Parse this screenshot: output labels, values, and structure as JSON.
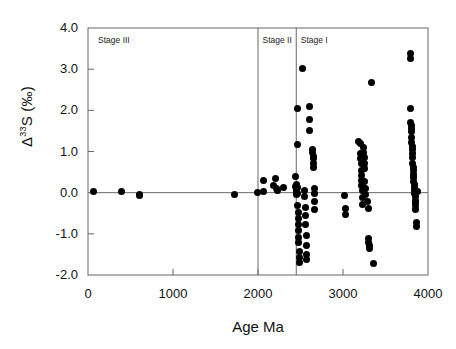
{
  "chart_data": {
    "type": "scatter",
    "title": "",
    "xlabel": "Age Ma",
    "ylabel": "Δ33S (‰)",
    "ylabel_base": "Δ",
    "ylabel_sup": "33",
    "ylabel_tail": "S (‰)",
    "xlim": [
      0,
      4000
    ],
    "ylim": [
      -2.0,
      4.0
    ],
    "xticks": [
      0,
      1000,
      2000,
      3000,
      4000
    ],
    "yticks": [
      4.0,
      3.0,
      2.0,
      1.0,
      0.0,
      -1.0,
      -2.0
    ],
    "xticklabels": [
      "0",
      "1000",
      "2000",
      "3000",
      "4000"
    ],
    "yticklabels": [
      "4.0",
      "3.0",
      "2.0",
      "1.0",
      "0.0",
      "-1.0",
      "-2.0"
    ],
    "grid": false,
    "legend": null,
    "marker": "filled-circle",
    "marker_color": "#000000",
    "zero_line": 0.0,
    "annotations": [
      {
        "label": "Stage III",
        "x_range": [
          0,
          2000
        ],
        "text_x": 95,
        "text_y": 3.72
      },
      {
        "label": "Stage II",
        "x_range": [
          2000,
          2450
        ],
        "text_x": 2030,
        "text_y": 3.72
      },
      {
        "label": "Stage I",
        "x_range": [
          2450,
          4000
        ],
        "text_x": 2480,
        "text_y": 3.72
      }
    ],
    "divider_lines": [
      2000,
      2450
    ],
    "series": [
      {
        "name": "Δ33S measurements",
        "points": [
          [
            60,
            0.02
          ],
          [
            390,
            0.03
          ],
          [
            600,
            -0.05
          ],
          [
            605,
            -0.08
          ],
          [
            1720,
            -0.04
          ],
          [
            1990,
            0.0
          ],
          [
            2060,
            0.3
          ],
          [
            2065,
            0.02
          ],
          [
            2180,
            0.18
          ],
          [
            2200,
            0.35
          ],
          [
            2215,
            0.1
          ],
          [
            2230,
            0.05
          ],
          [
            2300,
            0.12
          ],
          [
            2440,
            0.4
          ],
          [
            2445,
            0.15
          ],
          [
            2450,
            0.08
          ],
          [
            2452,
            0.02
          ],
          [
            2455,
            -0.05
          ],
          [
            2458,
            0.2
          ],
          [
            2460,
            2.05
          ],
          [
            2462,
            1.18
          ],
          [
            2465,
            0.12
          ],
          [
            2468,
            -0.02
          ],
          [
            2470,
            -0.3
          ],
          [
            2472,
            -0.48
          ],
          [
            2474,
            -0.62
          ],
          [
            2476,
            -0.78
          ],
          [
            2478,
            -0.92
          ],
          [
            2480,
            -1.08
          ],
          [
            2482,
            -1.22
          ],
          [
            2484,
            -1.42
          ],
          [
            2486,
            -1.58
          ],
          [
            2488,
            -1.7
          ],
          [
            2520,
            3.02
          ],
          [
            2545,
            0.05
          ],
          [
            2550,
            -0.1
          ],
          [
            2555,
            -0.35
          ],
          [
            2558,
            -0.55
          ],
          [
            2560,
            -0.78
          ],
          [
            2565,
            -1.05
          ],
          [
            2568,
            -1.28
          ],
          [
            2570,
            -1.5
          ],
          [
            2575,
            -1.62
          ],
          [
            2600,
            2.1
          ],
          [
            2605,
            1.78
          ],
          [
            2610,
            1.52
          ],
          [
            2640,
            1.05
          ],
          [
            2645,
            0.98
          ],
          [
            2648,
            0.88
          ],
          [
            2652,
            0.82
          ],
          [
            2655,
            0.72
          ],
          [
            2658,
            0.62
          ],
          [
            2662,
            0.1
          ],
          [
            2665,
            -0.02
          ],
          [
            2668,
            -0.22
          ],
          [
            2670,
            -0.42
          ],
          [
            3020,
            -0.08
          ],
          [
            3025,
            -0.38
          ],
          [
            3028,
            -0.52
          ],
          [
            3180,
            1.25
          ],
          [
            3200,
            1.2
          ],
          [
            3205,
            0.95
          ],
          [
            3208,
            0.82
          ],
          [
            3212,
            0.7
          ],
          [
            3215,
            0.55
          ],
          [
            3218,
            0.42
          ],
          [
            3220,
            0.3
          ],
          [
            3222,
            0.18
          ],
          [
            3225,
            0.05
          ],
          [
            3228,
            -0.12
          ],
          [
            3232,
            -0.28
          ],
          [
            3240,
            1.1
          ],
          [
            3245,
            0.98
          ],
          [
            3248,
            0.85
          ],
          [
            3252,
            0.72
          ],
          [
            3255,
            0.58
          ],
          [
            3258,
            0.28
          ],
          [
            3262,
            0.1
          ],
          [
            3265,
            -0.05
          ],
          [
            3290,
            -0.22
          ],
          [
            3295,
            -0.38
          ],
          [
            3300,
            -1.12
          ],
          [
            3305,
            -1.2
          ],
          [
            3308,
            -1.28
          ],
          [
            3312,
            -1.35
          ],
          [
            3340,
            2.68
          ],
          [
            3360,
            -1.72
          ],
          [
            3790,
            3.38
          ],
          [
            3792,
            3.25
          ],
          [
            3795,
            2.05
          ],
          [
            3798,
            1.7
          ],
          [
            3800,
            1.62
          ],
          [
            3802,
            1.55
          ],
          [
            3805,
            1.48
          ],
          [
            3808,
            1.35
          ],
          [
            3810,
            1.22
          ],
          [
            3812,
            1.12
          ],
          [
            3815,
            1.05
          ],
          [
            3818,
            0.95
          ],
          [
            3820,
            0.85
          ],
          [
            3822,
            0.72
          ],
          [
            3825,
            0.62
          ],
          [
            3828,
            0.55
          ],
          [
            3830,
            0.45
          ],
          [
            3832,
            0.38
          ],
          [
            3835,
            0.28
          ],
          [
            3838,
            0.2
          ],
          [
            3840,
            0.12
          ],
          [
            3842,
            0.05
          ],
          [
            3845,
            -0.02
          ],
          [
            3848,
            -0.1
          ],
          [
            3850,
            -0.18
          ],
          [
            3852,
            -0.25
          ],
          [
            3855,
            -0.32
          ],
          [
            3858,
            -0.4
          ],
          [
            3880,
            0.02
          ],
          [
            3868,
            -0.72
          ],
          [
            3870,
            -0.82
          ]
        ]
      }
    ]
  }
}
